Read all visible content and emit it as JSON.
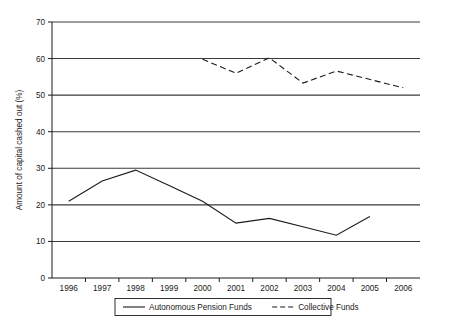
{
  "chart_data": {
    "type": "line",
    "title": "",
    "xlabel": "",
    "ylabel": "Amount of capital cashed out (%)",
    "x": [
      1996,
      1997,
      1998,
      1999,
      2000,
      2001,
      2002,
      2003,
      2004,
      2005,
      2006
    ],
    "xtick_labels": [
      "1996",
      "1997",
      "1998",
      "1999",
      "2000",
      "2001",
      "2002",
      "2003",
      "2004",
      "2005",
      "2006"
    ],
    "ytick_labels": [
      "0",
      "10",
      "20",
      "30",
      "40",
      "50",
      "60",
      "70"
    ],
    "yticks": [
      0,
      10,
      20,
      30,
      40,
      50,
      60,
      70
    ],
    "ylim": [
      0,
      70
    ],
    "xlim": [
      1995.5,
      2006.5
    ],
    "grid": "horizontal",
    "legend_position": "below-axes-center",
    "series": [
      {
        "name": "Autonomous Pension Funds",
        "style": "solid",
        "color": "#1a1a1a",
        "x": [
          1996,
          1997,
          1998,
          1999,
          2000,
          2001,
          2002,
          2003,
          2004,
          2005
        ],
        "values": [
          21.0,
          26.5,
          29.5,
          25.3,
          21.0,
          15.0,
          16.3,
          14.0,
          11.7,
          16.8
        ]
      },
      {
        "name": "Collective Funds",
        "style": "dashed",
        "color": "#1a1a1a",
        "x": [
          2000,
          2001,
          2002,
          2003,
          2004,
          2006
        ],
        "values": [
          59.8,
          56.0,
          60.2,
          53.3,
          56.6,
          52.0
        ]
      }
    ],
    "legend_entries": [
      {
        "label": "Autonomous Pension Funds",
        "style": "solid"
      },
      {
        "label": "Collective Funds",
        "style": "dashed"
      }
    ],
    "colors": {
      "axis": "#1a1a1a",
      "grid": "#3a3a3a",
      "background": "#ffffff",
      "series_primary": "#1a1a1a",
      "series_secondary": "#1a1a1a"
    }
  }
}
